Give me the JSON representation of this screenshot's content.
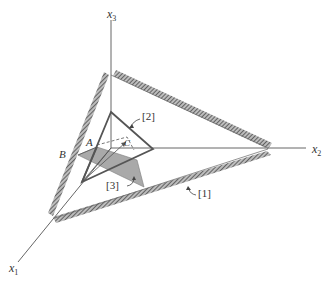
{
  "figure": {
    "type": "3d-coordinate-diagram",
    "axes": [
      {
        "id": "x1",
        "name": "x",
        "subscript": "1"
      },
      {
        "id": "x2",
        "name": "x",
        "subscript": "2"
      },
      {
        "id": "x3",
        "name": "x",
        "subscript": "3"
      }
    ],
    "points": [
      {
        "id": "A",
        "label": "A"
      },
      {
        "id": "B",
        "label": "B"
      },
      {
        "id": "C",
        "label": "C"
      }
    ],
    "callouts": [
      {
        "id": "1",
        "label": "[1]"
      },
      {
        "id": "2",
        "label": "[2]"
      },
      {
        "id": "3",
        "label": "[3]"
      }
    ],
    "colors": {
      "background": "#ffffff",
      "axis_line": "#555555",
      "hatched_band": "#6e6e6e",
      "inner_triangle": "#555555",
      "shaded_region": "#a9a9a9",
      "text": "#333333"
    }
  }
}
